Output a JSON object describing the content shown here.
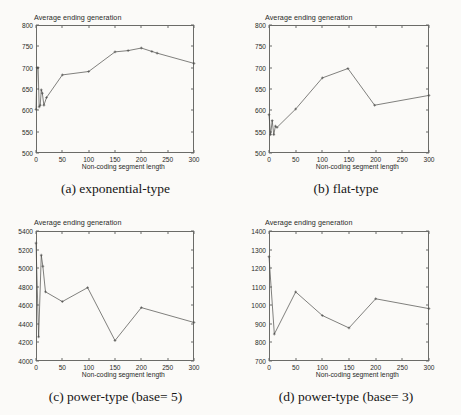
{
  "figure": {
    "background_color": "#fbfaf8",
    "line_color": "#4a4a48",
    "axis_color": "#6b6b68"
  },
  "panels": [
    {
      "id": "a",
      "caption": "(a) exponential-type",
      "chart_data": {
        "type": "line",
        "title": "",
        "ylabel": "Average ending generation",
        "xlabel": "Non-coding segment  length",
        "xlim": [
          0,
          300
        ],
        "ylim": [
          500,
          800
        ],
        "xticks": [
          0,
          50,
          100,
          150,
          200,
          250,
          300
        ],
        "yticks": [
          500,
          550,
          600,
          650,
          700,
          750,
          800
        ],
        "grid": false,
        "legend": null,
        "x": [
          0,
          2,
          4,
          6,
          8,
          10,
          12,
          15,
          20,
          50,
          100,
          150,
          175,
          200,
          220,
          230,
          300
        ],
        "y": [
          602,
          700,
          700,
          608,
          612,
          648,
          640,
          612,
          630,
          683,
          691,
          737,
          740,
          746,
          738,
          734,
          710
        ]
      }
    },
    {
      "id": "b",
      "caption": "(b) flat-type",
      "chart_data": {
        "type": "line",
        "title": "",
        "ylabel": "Average ending generation",
        "xlabel": "Non-coding segment  length",
        "xlim": [
          0,
          300
        ],
        "ylim": [
          500,
          800
        ],
        "xticks": [
          0,
          50,
          100,
          150,
          200,
          250,
          300
        ],
        "yticks": [
          500,
          550,
          600,
          650,
          700,
          750,
          800
        ],
        "grid": false,
        "legend": null,
        "x": [
          0,
          3,
          6,
          9,
          12,
          15,
          50,
          100,
          148,
          198,
          300
        ],
        "y": [
          590,
          543,
          576,
          543,
          563,
          560,
          603,
          676,
          698,
          612,
          635
        ]
      }
    },
    {
      "id": "c",
      "caption": "(c) power-type (base= 5)",
      "chart_data": {
        "type": "line",
        "title": "",
        "ylabel": "Average ending generation",
        "xlabel": "Non-coding segment  length",
        "xlim": [
          0,
          300
        ],
        "ylim": [
          4000,
          5400
        ],
        "xticks": [
          0,
          50,
          100,
          150,
          200,
          250,
          300
        ],
        "yticks": [
          4000,
          4200,
          4400,
          4600,
          4800,
          5000,
          5200,
          5400
        ],
        "grid": false,
        "legend": null,
        "x": [
          0,
          5,
          10,
          13,
          18,
          50,
          98,
          150,
          200,
          300
        ],
        "y": [
          5270,
          4260,
          5140,
          5020,
          4745,
          4640,
          4790,
          4220,
          4575,
          4415
        ]
      }
    },
    {
      "id": "d",
      "caption": "(d) power-type (base= 3)",
      "chart_data": {
        "type": "line",
        "title": "",
        "ylabel": "Average ending generation",
        "xlabel": "Non-coding segment  length",
        "xlim": [
          0,
          300
        ],
        "ylim": [
          700,
          1400
        ],
        "xticks": [
          0,
          50,
          100,
          150,
          200,
          250,
          300
        ],
        "yticks": [
          700,
          800,
          900,
          1000,
          1100,
          1200,
          1300,
          1400
        ],
        "grid": false,
        "legend": null,
        "x": [
          0,
          10,
          50,
          100,
          150,
          200,
          300
        ],
        "y": [
          1262,
          845,
          1072,
          945,
          878,
          1035,
          982
        ]
      }
    }
  ]
}
